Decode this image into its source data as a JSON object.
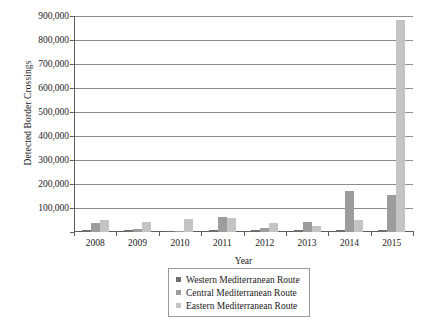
{
  "chart_data": {
    "type": "bar",
    "title": "",
    "xlabel": "Year",
    "ylabel": "Detected Border Crossings",
    "categories": [
      "2008",
      "2009",
      "2010",
      "2011",
      "2012",
      "2013",
      "2014",
      "2015"
    ],
    "ylim": [
      0,
      900000
    ],
    "ytick_labels": [
      "900,000",
      "800,000",
      "700,000",
      "600,000",
      "500,000",
      "400,000",
      "300,000",
      "200,000",
      "100,000"
    ],
    "ytick_values": [
      900000,
      800000,
      700000,
      600000,
      500000,
      400000,
      300000,
      200000,
      100000
    ],
    "grid": true,
    "legend_position": "bottom-center",
    "series": [
      {
        "name": "Western Mediterranean Route",
        "color": "#6e6e6e",
        "values": [
          6500,
          6600,
          5000,
          8500,
          6400,
          6800,
          7800,
          7200
        ]
      },
      {
        "name": "Central Mediterranean Route",
        "color": "#9c9c9c",
        "values": [
          39000,
          11000,
          4500,
          64000,
          15000,
          40000,
          170000,
          154000
        ]
      },
      {
        "name": "Eastern Mediterranean Route",
        "color": "#c4c4c4",
        "values": [
          52000,
          40000,
          56000,
          57000,
          37000,
          24800,
          51000,
          885000
        ]
      }
    ]
  }
}
